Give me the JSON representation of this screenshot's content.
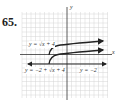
{
  "problem_number": "65.",
  "graph": {
    "axes": {
      "x_label": "x",
      "y_label": "y"
    },
    "curves": [
      {
        "name": "y = √(x+4)",
        "label": "y = √x + 4"
      },
      {
        "name": "y = -2 + √(x+4)",
        "label": "y = −2 + √x + 4"
      },
      {
        "name": "y = -2",
        "label": "y = −2"
      }
    ]
  },
  "labels": {
    "f1": "y = √x + 4",
    "f2": "y = −2 + √x + 4",
    "f3": "y = −2",
    "xaxis": "x",
    "yaxis": "y"
  },
  "colors": {
    "grid": "#cfcfcf",
    "axis": "#333333",
    "curve": "#222222"
  }
}
